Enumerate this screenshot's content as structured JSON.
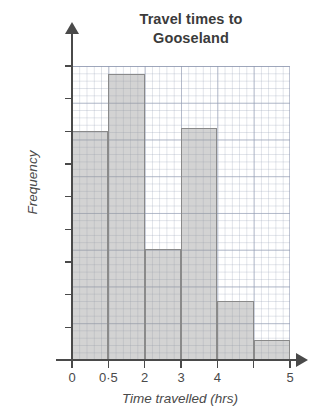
{
  "chart_data": {
    "type": "bar",
    "title": "Travel times to Gooseland",
    "title_lines": [
      "Travel times to",
      "Gooseland"
    ],
    "xlabel": "Time travelled (hrs)",
    "ylabel": "Frequency",
    "categories": [
      "0-0·5",
      "0·5-2",
      "2-3",
      "3-4",
      "4-4·5",
      "4·5-5"
    ],
    "values": [
      140,
      175,
      68,
      142,
      36,
      12
    ],
    "x_tick_labels": [
      "0",
      "0·5",
      "2",
      "3",
      "4",
      "",
      "5"
    ],
    "y_tick_labels": [
      "0",
      "20",
      "40",
      "60",
      "80",
      "100",
      "120",
      "140",
      "160",
      "180"
    ],
    "ylim": [
      0,
      180
    ],
    "y_tick_step": 20,
    "grid": true,
    "grid_style": "graph-paper",
    "legend": "none",
    "bar_fill_color": "#b4b4b4",
    "bar_border_color": "#8a8a8a",
    "axis_color": "#4a4a4a"
  }
}
